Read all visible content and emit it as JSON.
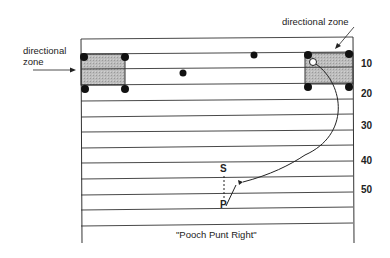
{
  "labels": {
    "left_zone": "directional\nzone",
    "left_zone_line1": "directional",
    "left_zone_line2": "zone",
    "right_zone": "directional zone",
    "caption": "\"Pooch Punt Right\""
  },
  "yard_markers": [
    "10",
    "20",
    "30",
    "40",
    "50"
  ],
  "players": {
    "snapper": "S",
    "punter": "P"
  },
  "colors": {
    "lines": "#333333",
    "zone_fill": "#b8b8b8",
    "dots": "#111111"
  },
  "field": {
    "horizontal_lines_y": [
      39,
      54,
      69,
      85,
      101,
      117,
      132,
      148,
      163,
      179,
      195,
      210,
      226
    ]
  }
}
